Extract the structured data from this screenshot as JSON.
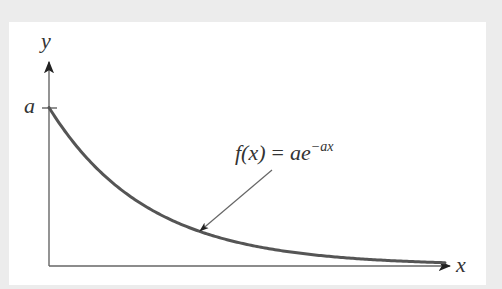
{
  "diagram": {
    "axes": {
      "x_label": "x",
      "y_label": "y",
      "y_tick_label": "a"
    },
    "annotation": {
      "func": "f(x)",
      "equals": "=",
      "base": "ae",
      "exponent": "−ax"
    },
    "colors": {
      "background": "#ececec",
      "panel": "#ffffff",
      "axis": "#666666",
      "curve": "#555555",
      "text": "#333333"
    }
  },
  "chart_data": {
    "type": "line",
    "title": "",
    "function": "f(x) = a e^(-a x)",
    "xlabel": "x",
    "ylabel": "y",
    "y_ticks": [
      "a"
    ],
    "series": [
      {
        "name": "f(x) = ae^{-ax}",
        "description": "exponential decay starting at y=a on the y-axis, asymptotically approaching the x-axis",
        "x": [
          0,
          0.1,
          0.2,
          0.3,
          0.4,
          0.5,
          0.6,
          0.7,
          0.8,
          0.9,
          1.0
        ],
        "y_relative_to_a": [
          1.0,
          0.67,
          0.46,
          0.31,
          0.21,
          0.14,
          0.09,
          0.06,
          0.04,
          0.03,
          0.02
        ]
      }
    ],
    "grid": false,
    "legend": "none"
  }
}
